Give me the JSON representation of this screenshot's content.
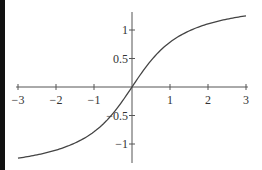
{
  "chart_data": {
    "type": "line",
    "title": "",
    "xlabel": "",
    "ylabel": "",
    "function": "arctan(x)",
    "xlim": [
      -3,
      3
    ],
    "ylim": [
      -1.25,
      1.25
    ],
    "grid": false,
    "legend": null,
    "x_ticks": [
      "-3",
      "-2",
      "-1",
      "1",
      "2",
      "3"
    ],
    "x_tick_labels": [
      "−3",
      "−2",
      "−1",
      "1",
      "2",
      "3"
    ],
    "y_tick_labels": [
      "1",
      "0.5",
      "−0.5",
      "−1"
    ],
    "y_ticks": [
      1,
      0.5,
      -0.5,
      -1
    ],
    "series": [
      {
        "name": "y = arctan(x)",
        "x": [
          -3,
          -2.5,
          -2,
          -1.5,
          -1,
          -0.5,
          0,
          0.5,
          1,
          1.5,
          2,
          2.5,
          3
        ],
        "values": [
          -1.249,
          -1.19,
          -1.107,
          -0.983,
          -0.785,
          -0.464,
          0,
          0.464,
          0.785,
          0.983,
          1.107,
          1.19,
          1.249
        ],
        "color": "#444444"
      }
    ]
  },
  "colors": {
    "axis": "#555555",
    "curve": "#444444",
    "left_bar": "#111111"
  }
}
